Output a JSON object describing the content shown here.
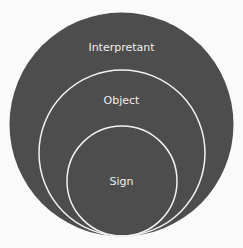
{
  "diagram": {
    "colors": {
      "fill": "#4d4d4d",
      "stroke": "#f2f2f2",
      "background": "#fafafa",
      "text": "#ededed"
    },
    "circles": [
      {
        "label": "Interpretant",
        "level": "outer"
      },
      {
        "label": "Object",
        "level": "middle"
      },
      {
        "label": "Sign",
        "level": "inner"
      }
    ]
  }
}
